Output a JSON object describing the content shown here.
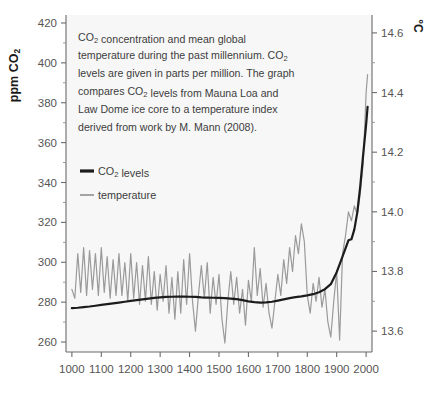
{
  "chart_data": {
    "type": "line",
    "title": "",
    "caption": [
      "CO₂ concentration and mean global",
      "temperature during the past millennium. CO₂",
      "levels are given in parts per million. The graph",
      "compares CO₂ levels from Mauna Loa and",
      "Law Dome ice core to a temperature index",
      "derived from work by M. Mann (2008)."
    ],
    "xlabel": "",
    "ylabel": "ppm CO₂",
    "ylabel_right": "°C",
    "xlim": [
      980,
      2020
    ],
    "ylim": [
      255,
      424
    ],
    "ylim_right": [
      13.53,
      14.66
    ],
    "xticks": [
      1000,
      1100,
      1200,
      1300,
      1400,
      1500,
      1600,
      1700,
      1800,
      1900,
      2000
    ],
    "xticklabels": [
      "1000",
      "1100",
      "1200",
      "1300",
      "1400",
      "1500",
      "1600",
      "1700",
      "1800",
      "1900",
      "2000"
    ],
    "yticks": [
      260,
      280,
      300,
      320,
      340,
      360,
      380,
      400,
      420
    ],
    "yticklabels": [
      "260",
      "280",
      "300",
      "320",
      "340",
      "360",
      "380",
      "400",
      "420"
    ],
    "yticks_minor": [
      270,
      290,
      310,
      330,
      350,
      370,
      390,
      410
    ],
    "yticks_right": [
      13.6,
      13.8,
      14.0,
      14.2,
      14.4,
      14.6
    ],
    "yticklabels_right": [
      "13.6",
      "13.8",
      "14.0",
      "14.2",
      "14.4",
      "14.6"
    ],
    "yticks_right_minor": [
      13.7,
      13.9,
      14.1,
      14.3,
      14.5
    ],
    "grid": false,
    "legend_position": "upper-left-inside",
    "colors": {
      "co2": "#1c1c1c",
      "temperature": "#9a9a9a",
      "plot_background": "#f7f7f7",
      "axis": "#6b6b6b"
    },
    "series": [
      {
        "name": "CO₂ levels",
        "axis": "left",
        "units": "ppm",
        "x": [
          1000,
          1020,
          1040,
          1060,
          1080,
          1100,
          1120,
          1140,
          1160,
          1180,
          1200,
          1220,
          1240,
          1260,
          1280,
          1300,
          1320,
          1340,
          1360,
          1380,
          1400,
          1420,
          1440,
          1460,
          1480,
          1500,
          1520,
          1540,
          1560,
          1580,
          1600,
          1620,
          1640,
          1660,
          1680,
          1700,
          1720,
          1740,
          1760,
          1780,
          1800,
          1820,
          1840,
          1860,
          1880,
          1900,
          1910,
          1920,
          1930,
          1940,
          1950,
          1960,
          1970,
          1980,
          1990,
          2000,
          2005
        ],
        "values": [
          277.0,
          277.2,
          277.5,
          277.8,
          278.2,
          278.6,
          279.0,
          279.4,
          279.8,
          280.2,
          280.6,
          281.0,
          281.4,
          281.8,
          282.1,
          282.4,
          282.6,
          282.7,
          282.8,
          282.8,
          282.7,
          282.6,
          282.4,
          282.3,
          282.2,
          282.1,
          282.0,
          281.8,
          281.5,
          281.0,
          280.4,
          280.0,
          279.8,
          279.9,
          280.2,
          280.8,
          281.4,
          282.0,
          282.5,
          282.9,
          283.4,
          284.0,
          285.0,
          286.5,
          289.0,
          295.0,
          299.0,
          303.0,
          307.0,
          311.0,
          311.5,
          316.5,
          325.0,
          338.0,
          354.0,
          369.0,
          378.0
        ]
      },
      {
        "name": "temperature",
        "axis": "right",
        "units": "°C",
        "x": [
          1000,
          1010,
          1020,
          1030,
          1040,
          1050,
          1060,
          1070,
          1080,
          1090,
          1100,
          1110,
          1120,
          1130,
          1140,
          1150,
          1160,
          1170,
          1180,
          1190,
          1200,
          1210,
          1220,
          1230,
          1240,
          1250,
          1260,
          1270,
          1280,
          1290,
          1300,
          1310,
          1320,
          1330,
          1340,
          1350,
          1360,
          1370,
          1380,
          1390,
          1400,
          1410,
          1420,
          1430,
          1440,
          1450,
          1460,
          1470,
          1480,
          1490,
          1500,
          1510,
          1520,
          1530,
          1540,
          1550,
          1560,
          1570,
          1580,
          1590,
          1600,
          1610,
          1620,
          1630,
          1640,
          1650,
          1660,
          1670,
          1680,
          1690,
          1700,
          1710,
          1720,
          1730,
          1740,
          1750,
          1760,
          1770,
          1780,
          1790,
          1800,
          1810,
          1820,
          1830,
          1840,
          1850,
          1860,
          1870,
          1880,
          1890,
          1900,
          1910,
          1920,
          1930,
          1940,
          1950,
          1960,
          1970,
          1980,
          1990,
          2000,
          2005
        ],
        "values": [
          13.74,
          13.71,
          13.86,
          13.73,
          13.88,
          13.72,
          13.87,
          13.74,
          13.86,
          13.72,
          13.88,
          13.73,
          13.85,
          13.71,
          13.84,
          13.72,
          13.86,
          13.72,
          13.83,
          13.7,
          13.86,
          13.71,
          13.83,
          13.69,
          13.82,
          13.7,
          13.85,
          13.69,
          13.8,
          13.67,
          13.79,
          13.7,
          13.82,
          13.66,
          13.78,
          13.64,
          13.8,
          13.66,
          13.84,
          13.69,
          13.86,
          13.7,
          13.6,
          13.72,
          13.82,
          13.71,
          13.83,
          13.66,
          13.78,
          13.69,
          13.79,
          13.64,
          13.56,
          13.7,
          13.8,
          13.69,
          13.78,
          13.66,
          13.74,
          13.62,
          13.77,
          13.7,
          13.88,
          13.72,
          13.81,
          13.68,
          13.76,
          13.66,
          13.61,
          13.7,
          13.79,
          13.72,
          13.84,
          13.76,
          13.88,
          13.8,
          13.92,
          13.86,
          13.96,
          13.9,
          13.72,
          13.66,
          13.76,
          13.7,
          13.78,
          13.68,
          13.74,
          13.63,
          13.58,
          13.7,
          13.8,
          13.57,
          13.86,
          13.92,
          14.0,
          13.97,
          14.02,
          13.99,
          14.06,
          14.16,
          14.4,
          14.46
        ]
      }
    ]
  },
  "legend": {
    "items": [
      {
        "label": "CO₂ levels",
        "color": "#1c1c1c"
      },
      {
        "label": "temperature",
        "color": "#9a9a9a"
      }
    ]
  }
}
